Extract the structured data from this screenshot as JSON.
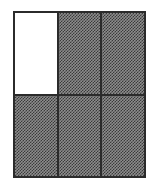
{
  "figure": {
    "kind": "area-model-grid",
    "rows": 2,
    "columns": 3,
    "total_cells": 6,
    "shaded_cells": 5,
    "unshaded_cells": 1,
    "fraction_shaded": "5/6",
    "fraction_unshaded": "1/6",
    "colors": {
      "outline": "#2b2b2b",
      "divider": "#2b2b2b",
      "shaded_fill_dark": "#3a3a3a",
      "shaded_fill_light": "#8d8d8d",
      "unshaded_fill": "#ffffff",
      "background": "#ffffff"
    },
    "cells": [
      {
        "row": 1,
        "column": 1,
        "shaded": false,
        "label": ""
      },
      {
        "row": 1,
        "column": 2,
        "shaded": true,
        "label": ""
      },
      {
        "row": 1,
        "column": 3,
        "shaded": true,
        "label": ""
      },
      {
        "row": 2,
        "column": 1,
        "shaded": true,
        "label": ""
      },
      {
        "row": 2,
        "column": 2,
        "shaded": true,
        "label": ""
      },
      {
        "row": 2,
        "column": 3,
        "shaded": true,
        "label": ""
      }
    ]
  }
}
